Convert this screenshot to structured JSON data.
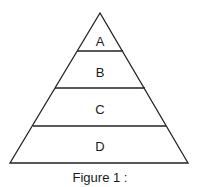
{
  "diagram": {
    "type": "pyramid",
    "levels": [
      {
        "label": "A"
      },
      {
        "label": "B"
      },
      {
        "label": "C"
      },
      {
        "label": "D"
      }
    ],
    "caption": "Figure 1 :"
  }
}
